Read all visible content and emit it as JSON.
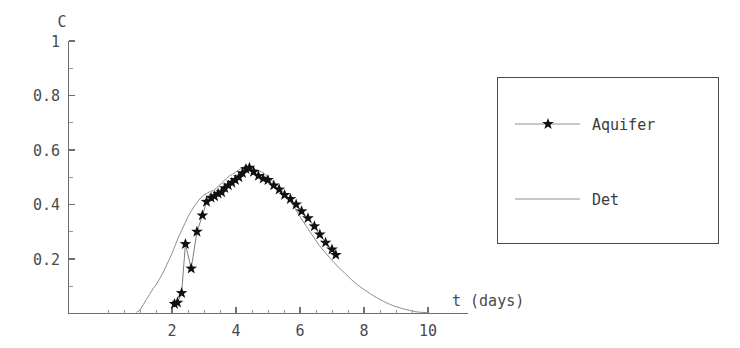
{
  "figure": {
    "width": 740,
    "height": 348,
    "background": "#ffffff",
    "axis_color": "#6e6e6e",
    "text_color": "#4a4a4a"
  },
  "chart_data": {
    "type": "line",
    "title": "",
    "subtitle": "",
    "xlabel": "t (days)",
    "ylabel": "C",
    "xlim": [
      0,
      10.4
    ],
    "ylim": [
      0,
      1.02
    ],
    "grid": false,
    "x_ticks_major": [
      2,
      4,
      6,
      8,
      10
    ],
    "x_ticks_major_labels": [
      "2",
      "4",
      "6",
      "8",
      "10"
    ],
    "x_ticks_minor_step": 0.5,
    "y_ticks_major": [
      0.2,
      0.4,
      0.6,
      0.8,
      1
    ],
    "y_ticks_major_labels": [
      "0.2",
      "0.4",
      "0.6",
      "0.8",
      "1"
    ],
    "legend_position": "outside-right",
    "series": [
      {
        "name": "Aquifer",
        "marker": "star",
        "line_color": "#7d7d7d",
        "marker_color": "#101010",
        "x": [
          2.08,
          2.17,
          2.3,
          2.42,
          2.6,
          2.78,
          2.95,
          3.08,
          3.22,
          3.33,
          3.44,
          3.55,
          3.65,
          3.76,
          3.87,
          3.98,
          4.09,
          4.2,
          4.31,
          4.42,
          4.55,
          4.7,
          4.85,
          5.0,
          5.18,
          5.35,
          5.52,
          5.7,
          5.88,
          6.05,
          6.25,
          6.45,
          6.62,
          6.8,
          7.0,
          7.12
        ],
        "y": [
          0.035,
          0.04,
          0.075,
          0.255,
          0.165,
          0.3,
          0.36,
          0.41,
          0.425,
          0.43,
          0.44,
          0.445,
          0.46,
          0.47,
          0.48,
          0.49,
          0.5,
          0.515,
          0.53,
          0.535,
          0.52,
          0.505,
          0.495,
          0.49,
          0.47,
          0.455,
          0.435,
          0.42,
          0.4,
          0.375,
          0.35,
          0.32,
          0.29,
          0.26,
          0.235,
          0.215
        ]
      },
      {
        "name": "Det",
        "marker": "none",
        "line_color": "#8e8e8e",
        "x": [
          0.9,
          1.0,
          1.1,
          1.2,
          1.3,
          1.4,
          1.5,
          1.6,
          1.7,
          1.8,
          1.9,
          2.0,
          2.1,
          2.2,
          2.3,
          2.4,
          2.5,
          2.6,
          2.7,
          2.8,
          2.9,
          3.0,
          3.1,
          3.2,
          3.3,
          3.4,
          3.5,
          3.6,
          3.7,
          3.8,
          3.9,
          4.0,
          4.1,
          4.2,
          4.3,
          4.4,
          4.5,
          4.6,
          4.7,
          4.8,
          4.9,
          5.0,
          5.15,
          5.3,
          5.45,
          5.6,
          5.8,
          6.0,
          6.2,
          6.4,
          6.6,
          6.8,
          7.0,
          7.2,
          7.4,
          7.6,
          7.8,
          8.0,
          8.2,
          8.4,
          8.6,
          8.8,
          9.0,
          9.2,
          9.4,
          9.55,
          9.7,
          10.0
        ],
        "y": [
          0.005,
          0.012,
          0.032,
          0.052,
          0.07,
          0.09,
          0.105,
          0.125,
          0.145,
          0.17,
          0.195,
          0.22,
          0.25,
          0.28,
          0.305,
          0.33,
          0.355,
          0.375,
          0.395,
          0.41,
          0.425,
          0.435,
          0.442,
          0.448,
          0.452,
          0.462,
          0.472,
          0.485,
          0.495,
          0.505,
          0.512,
          0.52,
          0.528,
          0.535,
          0.54,
          0.54,
          0.535,
          0.528,
          0.525,
          0.52,
          0.512,
          0.5,
          0.485,
          0.468,
          0.45,
          0.43,
          0.395,
          0.355,
          0.32,
          0.285,
          0.25,
          0.222,
          0.195,
          0.17,
          0.148,
          0.125,
          0.105,
          0.088,
          0.072,
          0.058,
          0.045,
          0.034,
          0.025,
          0.018,
          0.012,
          0.008,
          0.005,
          0.003
        ]
      }
    ]
  },
  "legend": {
    "entries": [
      {
        "label": "Aquifer",
        "marker": "star"
      },
      {
        "label": "Det",
        "marker": "none"
      }
    ]
  }
}
